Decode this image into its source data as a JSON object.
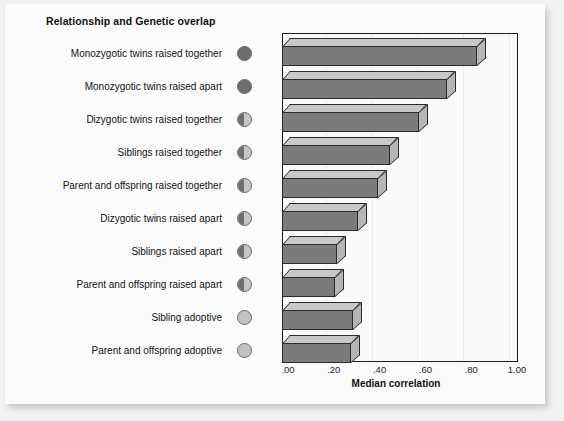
{
  "chart_data": {
    "type": "bar",
    "orientation": "horizontal",
    "title": "Relationship and Genetic overlap",
    "xlabel": "Median correlation",
    "ylabel": "",
    "xlim": [
      0,
      1.0
    ],
    "xticks": [
      ".00",
      ".20",
      ".40",
      ".60",
      ".80",
      "1.00"
    ],
    "xtick_values": [
      0.0,
      0.2,
      0.4,
      0.6,
      0.8,
      1.0
    ],
    "grid": true,
    "legend": "none",
    "categories": [
      "Monozygotic twins raised together",
      "Monozygotic twins raised apart",
      "Dizygotic twins raised together",
      "Siblings raised together",
      "Parent and offspring raised together",
      "Dizygotic twins raised apart",
      "Siblings raised apart",
      "Parent and offspring raised apart",
      "Sibling adoptive",
      "Parent and offspring adoptive"
    ],
    "values": [
      0.85,
      0.72,
      0.6,
      0.47,
      0.42,
      0.33,
      0.24,
      0.23,
      0.31,
      0.3
    ],
    "genetic_overlap": [
      "full",
      "full",
      "half",
      "half",
      "half",
      "half",
      "half",
      "half",
      "empty",
      "empty"
    ],
    "colors": {
      "bar_front": "#7b7b7b",
      "bar_top": "#c9c9c9",
      "bar_side": "#b6b6b6",
      "bar_outline": "#2a2a2a",
      "circle_full": "#6e6e6e",
      "circle_empty": "#c2c2c2",
      "plot_background": "#fafafa",
      "card_background": "#fbfbfb",
      "page_background": "#f2f2f2"
    }
  }
}
